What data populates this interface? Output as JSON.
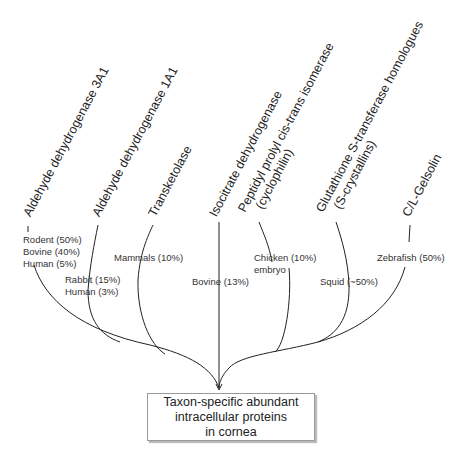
{
  "root": {
    "lines": [
      "Taxon-specific abundant",
      "intracellular proteins",
      "in cornea"
    ]
  },
  "proteins": [
    {
      "name": "Aldehyde dehydrogenase 3A1",
      "taxa": [
        "Rodent (50%)",
        "Bovine (40%)",
        "Human (5%)"
      ]
    },
    {
      "name": "Aldehyde dehydrogenase 1A1",
      "taxa": [
        "Rabbit (15%)",
        "Human (3%)"
      ]
    },
    {
      "name": "Transketolase",
      "taxa": [
        "Mammals (10%)"
      ]
    },
    {
      "name": "Isocitrate dehydrogenase",
      "taxa": [
        "Bovine (13%)"
      ]
    },
    {
      "name_lines": [
        "Peptidyl prolyl cis-trans isomerase",
        "(cyclophilin)"
      ],
      "taxa": [
        "Chicken (10%)",
        "embryo"
      ]
    },
    {
      "name_lines": [
        "Glutathione S-transferase homologues",
        "(S-crystallins)"
      ],
      "taxa": [
        "Squid (~50%)"
      ]
    },
    {
      "name": "C/L-Gelsolin",
      "taxa": [
        "Zebrafish (50%)"
      ]
    }
  ],
  "colors": {
    "line": "#222222",
    "text": "#2a2a2a",
    "box_border": "#999999"
  }
}
